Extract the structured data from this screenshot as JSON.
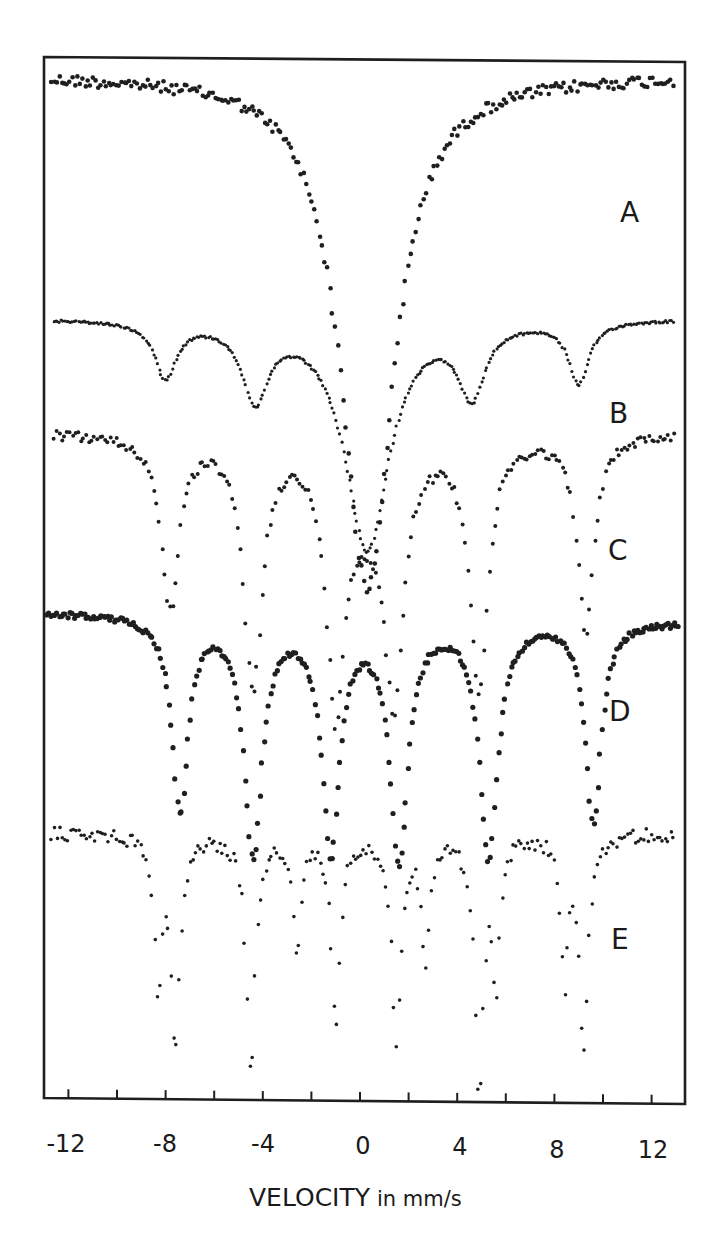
{
  "chart_data": {
    "type": "scatter",
    "title": "",
    "xlabel": "VELOCITY in mm/s",
    "ylabel": "",
    "xlim": [
      -13,
      13.4
    ],
    "x_ticks_major_labels": [
      "-12",
      "-8",
      "-4",
      "0",
      "4",
      "8",
      "12"
    ],
    "x_tick_values_major": [
      -12,
      -8,
      -4,
      0,
      4,
      8,
      12
    ],
    "x_tick_values_minor": [
      -12,
      -10,
      -8,
      -6,
      -4,
      -2,
      0,
      2,
      4,
      6,
      8,
      10,
      12
    ],
    "grid": false,
    "legend": "inline curve labels on right side",
    "series": [
      {
        "name": "A",
        "shape": "broad single absorption",
        "baseline_y_px": 75,
        "features": [
          {
            "velocity": 0.3,
            "depth_px": 515,
            "width": 2.6,
            "kind": "lorentzian"
          }
        ],
        "slope_px_per_mm_s": 0
      },
      {
        "name": "B",
        "shape": "central doublet-like dip with weak magnetic shoulders",
        "baseline_y_px": 318,
        "features": [
          {
            "velocity": -8.0,
            "depth_px": 55,
            "width": 1.1
          },
          {
            "velocity": -4.3,
            "depth_px": 75,
            "width": 1.3
          },
          {
            "velocity": 0.3,
            "depth_px": 230,
            "width": 2.2
          },
          {
            "velocity": 4.6,
            "depth_px": 70,
            "width": 1.3
          },
          {
            "velocity": 9.0,
            "depth_px": 62,
            "width": 1.0
          }
        ]
      },
      {
        "name": "C",
        "shape": "magnetic sextet with central doublet",
        "baseline_y_px": 432,
        "features": [
          {
            "velocity": -7.8,
            "depth_px": 170,
            "width": 0.9
          },
          {
            "velocity": -4.4,
            "depth_px": 250,
            "width": 0.9
          },
          {
            "velocity": -1.0,
            "depth_px": 250,
            "width": 0.9
          },
          {
            "velocity": 1.4,
            "depth_px": 235,
            "width": 0.9
          },
          {
            "velocity": 4.9,
            "depth_px": 250,
            "width": 0.9
          },
          {
            "velocity": 9.3,
            "depth_px": 200,
            "width": 0.8
          },
          {
            "velocity": 0.3,
            "depth_px": 60,
            "width": 2.5
          }
        ]
      },
      {
        "name": "D",
        "shape": "broadened magnetic sextet",
        "baseline_y_px": 612,
        "features": [
          {
            "velocity": -7.4,
            "depth_px": 195,
            "width": 0.8
          },
          {
            "velocity": -4.4,
            "depth_px": 235,
            "width": 0.9
          },
          {
            "velocity": -1.2,
            "depth_px": 230,
            "width": 0.9
          },
          {
            "velocity": 1.6,
            "depth_px": 240,
            "width": 0.9
          },
          {
            "velocity": 5.3,
            "depth_px": 235,
            "width": 0.9
          },
          {
            "velocity": 9.6,
            "depth_px": 200,
            "width": 0.8
          }
        ]
      },
      {
        "name": "E",
        "shape": "two superposed sextets (sharp lines)",
        "baseline_y_px": 833,
        "features": [
          {
            "velocity": -7.6,
            "depth_px": 205,
            "width": 0.45
          },
          {
            "velocity": -8.3,
            "depth_px": 150,
            "width": 0.35
          },
          {
            "velocity": -4.5,
            "depth_px": 240,
            "width": 0.45
          },
          {
            "velocity": -1.0,
            "depth_px": 185,
            "width": 0.45
          },
          {
            "velocity": -2.6,
            "depth_px": 120,
            "width": 0.4
          },
          {
            "velocity": 1.5,
            "depth_px": 205,
            "width": 0.45
          },
          {
            "velocity": 2.7,
            "depth_px": 120,
            "width": 0.4
          },
          {
            "velocity": 4.9,
            "depth_px": 255,
            "width": 0.45
          },
          {
            "velocity": 5.6,
            "depth_px": 140,
            "width": 0.35
          },
          {
            "velocity": 9.2,
            "depth_px": 215,
            "width": 0.45
          },
          {
            "velocity": 8.4,
            "depth_px": 140,
            "width": 0.35
          }
        ]
      }
    ]
  },
  "labels": {
    "curve_A": "A",
    "curve_B": "B",
    "curve_C": "C",
    "curve_D": "D",
    "curve_E": "E"
  },
  "axis": {
    "xlabel_main": "VELOCITY",
    "xlabel_unit": "in mm/s",
    "tick_labels": [
      "-12",
      "-8",
      "-4",
      "0",
      "4",
      "8",
      "12"
    ]
  },
  "style": {
    "ink": "#1f1f1f",
    "background": "#ffffff"
  }
}
